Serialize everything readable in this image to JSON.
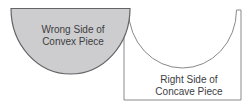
{
  "diagram": {
    "convex_piece": {
      "label_line1": "Wrong Side of",
      "label_line2": "Convex Piece",
      "fill": "#cdcdcf",
      "outline": "#636466"
    },
    "concave_piece": {
      "label_line1": "Right Side of",
      "label_line2": "Concave Piece",
      "fill": "#ffffff",
      "outline": "#88898c"
    },
    "colors": {
      "background": "#ffffff",
      "text": "#3d3d3f"
    }
  }
}
